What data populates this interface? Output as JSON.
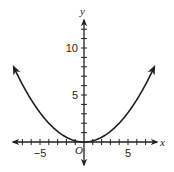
{
  "chart_data": {
    "type": "line",
    "title": "",
    "xlabel": "x",
    "ylabel": "y",
    "origin_label": "O",
    "xlim": [
      -8,
      8
    ],
    "ylim": [
      -2,
      12
    ],
    "x_ticks": [
      -7,
      -6,
      -5,
      -4,
      -3,
      -2,
      -1,
      1,
      2,
      3,
      4,
      5,
      6,
      7
    ],
    "y_ticks": [
      1,
      2,
      3,
      4,
      5,
      6,
      7,
      8,
      9,
      10,
      11,
      12
    ],
    "x_tick_labels": [
      {
        "value": -5,
        "label": "−5"
      },
      {
        "value": 5,
        "label": "5"
      }
    ],
    "y_tick_labels": [
      {
        "value": 5,
        "label": "5"
      },
      {
        "value": 10,
        "label": "10"
      }
    ],
    "grid": false,
    "series": [
      {
        "name": "curve",
        "equation": "y = x^2 / 8",
        "x": [
          -8,
          -7,
          -6,
          -5,
          -4,
          -3,
          -2,
          -1,
          0,
          1,
          2,
          3,
          4,
          5,
          6,
          7,
          8
        ],
        "values": [
          8,
          6.125,
          4.5,
          3.125,
          2,
          1.125,
          0.5,
          0.125,
          0,
          0.125,
          0.5,
          1.125,
          2,
          3.125,
          4.5,
          6.125,
          8
        ],
        "arrows_at_ends": true,
        "color": "#231f20"
      }
    ]
  },
  "colors": {
    "ink": "#231f20",
    "background": "#ffffff"
  }
}
